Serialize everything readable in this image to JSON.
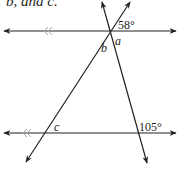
{
  "caption": {
    "text": "b, and c."
  },
  "colors": {
    "line": "#231f20",
    "parallel_mark": "#a7a9ac",
    "background": "#ffffff"
  },
  "labels": {
    "angle_top": "58°",
    "var_a": "a",
    "var_b": "b",
    "var_c": "c",
    "angle_bottom": "105°"
  },
  "diagram": {
    "parallel_lines": [
      {
        "name": "top-line",
        "y": 31,
        "x1": 3,
        "x2": 177,
        "marks": "double-chevron",
        "mark_x": 45
      },
      {
        "name": "bottom-line",
        "y": 133,
        "x1": 3,
        "x2": 177,
        "marks": "double-chevron",
        "mark_x": 24
      }
    ],
    "transversals": [
      {
        "name": "transversal-1",
        "from": [
          102,
          1
        ],
        "to": [
          147,
          163
        ]
      },
      {
        "name": "transversal-2",
        "from": [
          130,
          1
        ],
        "to": [
          26,
          162
        ]
      }
    ]
  }
}
